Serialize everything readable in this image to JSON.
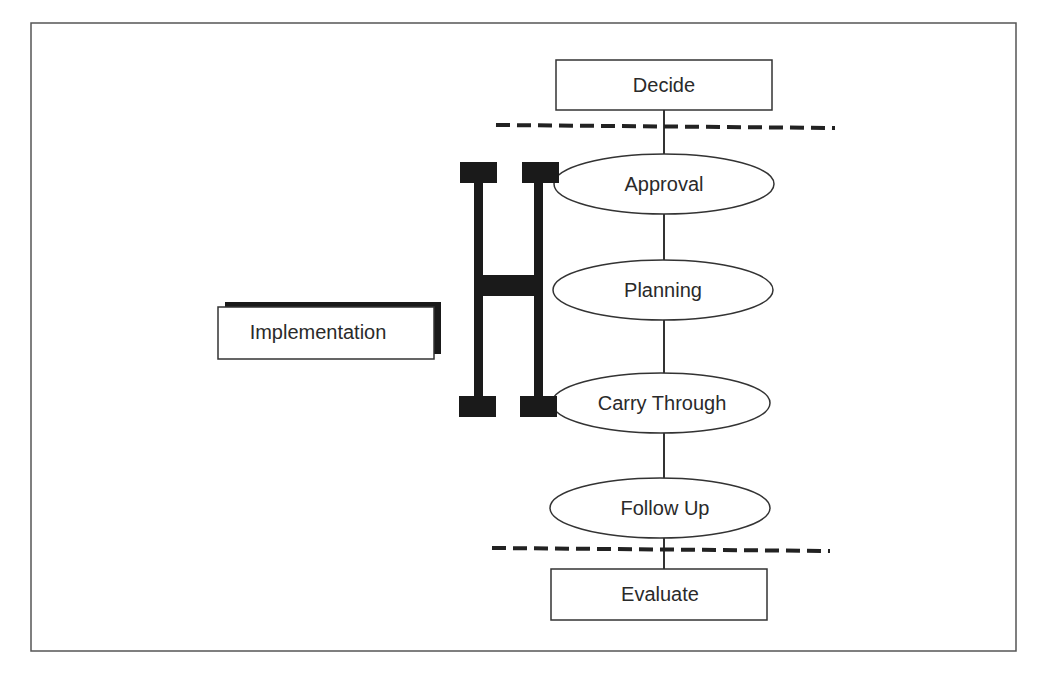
{
  "diagram": {
    "colors": {
      "stroke": "#3a3a3a",
      "fill": "#ffffff",
      "bracket": "#1a1a1a",
      "text": "#2a2a2a"
    },
    "boxes": {
      "top": {
        "label": "Decide"
      },
      "bottom": {
        "label": "Evaluate"
      },
      "side": {
        "label": "Implementation"
      }
    },
    "steps": [
      {
        "label": "Approval"
      },
      {
        "label": "Planning"
      },
      {
        "label": "Carry Through"
      },
      {
        "label": "Follow Up"
      }
    ],
    "separators": [
      "dashed-line-upper",
      "dashed-line-lower"
    ],
    "bracket_icon": "h-bracket-icon"
  }
}
